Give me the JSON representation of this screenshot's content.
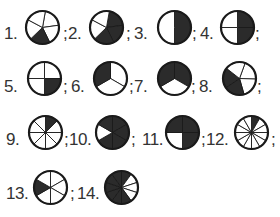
{
  "worksheet": {
    "title": "Fraction circles",
    "separator": ";",
    "shade_color": "#2b2b2b",
    "line_color": "#1a1a1a",
    "items": [
      {
        "label": "1.",
        "parts": 5,
        "shaded": [
          2
        ],
        "start": -80,
        "cx": 42,
        "cy": 27,
        "lx": 4,
        "ly": 35,
        "sx": 63,
        "sy": 35
      },
      {
        "label": "2.",
        "parts": 5,
        "shaded": [
          0,
          1,
          2
        ],
        "start": -80,
        "cx": 106,
        "cy": 27,
        "lx": 68,
        "ly": 35,
        "sx": 126,
        "sy": 35
      },
      {
        "label": "3.",
        "parts": 2,
        "shaded": [
          0
        ],
        "start": -90,
        "cx": 174,
        "cy": 27,
        "lx": 134,
        "ly": 35,
        "sx": 192,
        "sy": 35
      },
      {
        "label": "4.",
        "parts": 4,
        "shaded": [
          0,
          1
        ],
        "start": -90,
        "cx": 237,
        "cy": 27,
        "lx": 200,
        "ly": 35,
        "sx": 255,
        "sy": 35
      },
      {
        "label": "5.",
        "parts": 4,
        "shaded": [
          1
        ],
        "start": -90,
        "cx": 44,
        "cy": 78,
        "lx": 4,
        "ly": 88,
        "sx": 63,
        "sy": 88
      },
      {
        "label": "6.",
        "parts": 3,
        "shaded": [
          2
        ],
        "start": -90,
        "cx": 110,
        "cy": 78,
        "lx": 71,
        "ly": 88,
        "sx": 129,
        "sy": 88
      },
      {
        "label": "7.",
        "parts": 3,
        "shaded": [
          0,
          2
        ],
        "start": -90,
        "cx": 174,
        "cy": 78,
        "lx": 134,
        "ly": 88,
        "sx": 191,
        "sy": 88
      },
      {
        "label": "8.",
        "parts": 5,
        "shaded": [
          2,
          3
        ],
        "start": -70,
        "cx": 239,
        "cy": 78,
        "lx": 199,
        "ly": 88,
        "sx": 257,
        "sy": 88
      },
      {
        "label": "9.",
        "parts": 8,
        "shaded": [
          0
        ],
        "start": -90,
        "cx": 45,
        "cy": 132,
        "lx": 6,
        "ly": 141,
        "sx": 64,
        "sy": 141
      },
      {
        "label": "10.",
        "parts": 6,
        "shaded": [
          0,
          1,
          2,
          3,
          5
        ],
        "start": -90,
        "cx": 112,
        "cy": 132,
        "lx": 69,
        "ly": 141,
        "sx": 131,
        "sy": 141
      },
      {
        "label": "11.",
        "parts": 4,
        "shaded": [
          0,
          1,
          3
        ],
        "start": -90,
        "cx": 182,
        "cy": 132,
        "lx": 142,
        "ly": 141,
        "sx": 201,
        "sy": 141
      },
      {
        "label": "12.",
        "parts": 12,
        "shaded": [
          0
        ],
        "start": -90,
        "cx": 251,
        "cy": 132,
        "lx": 206,
        "ly": 141,
        "sx": 271,
        "sy": 141
      },
      {
        "label": "13.",
        "parts": 6,
        "shaded": [
          4
        ],
        "start": -90,
        "cx": 50,
        "cy": 187,
        "lx": 6,
        "ly": 195,
        "sx": 70,
        "sy": 195
      },
      {
        "label": "14.",
        "parts": 10,
        "shaded": [
          0,
          5,
          6,
          7,
          8,
          9,
          4
        ],
        "start": -90,
        "cx": 121,
        "cy": 187,
        "lx": 77,
        "ly": 195,
        "sx": null,
        "sy": null
      }
    ]
  }
}
